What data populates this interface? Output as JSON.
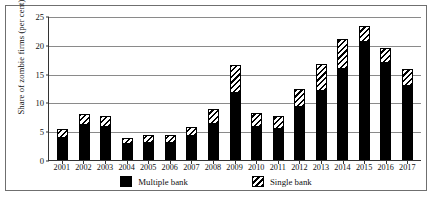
{
  "chart_data": {
    "type": "bar",
    "title": "",
    "xlabel": "",
    "ylabel": "Share of zombie firms (per cent)",
    "ylim": [
      0,
      25
    ],
    "yticks": [
      0,
      5,
      10,
      15,
      20,
      25
    ],
    "grid": true,
    "stacked": true,
    "legend_position": "bottom",
    "categories": [
      "2001",
      "2002",
      "2003",
      "2004",
      "2005",
      "2006",
      "2007",
      "2008",
      "2009",
      "2010",
      "2011",
      "2012",
      "2013",
      "2014",
      "2015",
      "2016",
      "2017"
    ],
    "series": [
      {
        "name": "Multiple bank",
        "pattern": "solid-black",
        "color": "#000000",
        "values": [
          3.9,
          6.0,
          5.8,
          2.7,
          2.9,
          3.0,
          4.2,
          6.2,
          11.6,
          5.8,
          5.4,
          9.2,
          12.0,
          15.8,
          20.5,
          16.8,
          12.8
        ]
      },
      {
        "name": "Single bank",
        "pattern": "diagonal-hatch",
        "color": "#ffffff",
        "values": [
          1.5,
          2.0,
          1.9,
          1.1,
          1.4,
          1.4,
          1.6,
          2.6,
          4.9,
          2.3,
          2.2,
          3.1,
          4.7,
          5.2,
          2.8,
          2.7,
          3.0
        ]
      }
    ],
    "totals": [
      5.4,
      8.0,
      7.7,
      3.8,
      4.3,
      4.4,
      5.8,
      8.8,
      16.5,
      8.1,
      7.6,
      12.3,
      16.7,
      21.0,
      23.3,
      19.5,
      15.8
    ]
  },
  "legend": {
    "items": [
      {
        "label": "Multiple bank",
        "swatch": "solid-black-swatch"
      },
      {
        "label": "Single bank",
        "swatch": "hatched-swatch"
      }
    ]
  }
}
